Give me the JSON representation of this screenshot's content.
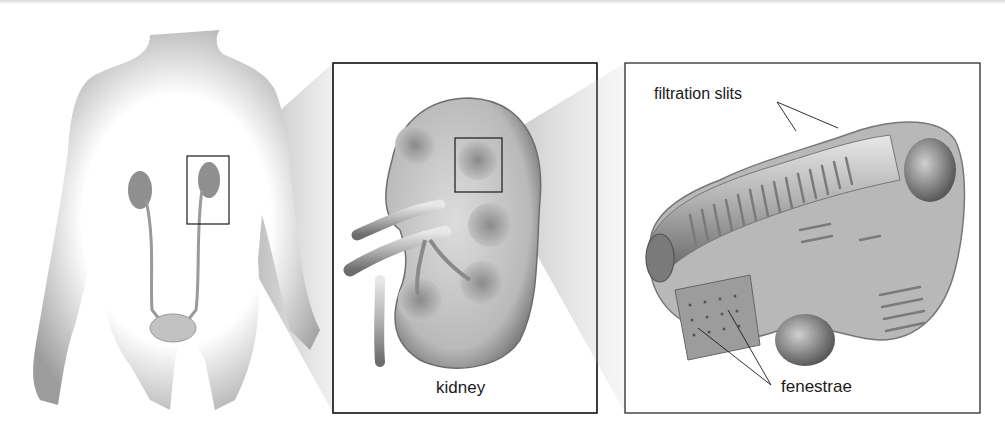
{
  "figure": {
    "panels": [
      {
        "id": "body",
        "description": "human torso silhouette with urinary system",
        "structures": [
          "kidneys",
          "ureters",
          "bladder"
        ]
      },
      {
        "id": "kidney-section",
        "label": "kidney"
      },
      {
        "id": "glomerular-capillary",
        "callouts": [
          "filtration slits",
          "fenestrae"
        ]
      }
    ],
    "labels": {
      "kidney": "kidney",
      "filtration_slits": "filtration slits",
      "fenestrae": "fenestrae"
    },
    "colors": {
      "background": "#ffffff",
      "line": "#1a1a1a",
      "shade_dark": "#6e6e6e",
      "shade_mid": "#a8a8a8",
      "shade_light": "#e2e2e2"
    }
  }
}
